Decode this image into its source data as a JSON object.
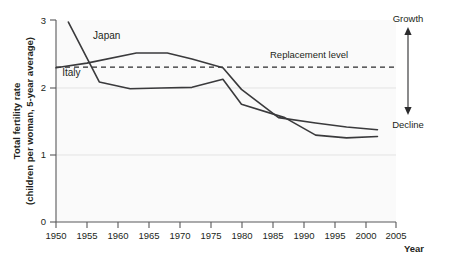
{
  "chart_data": {
    "type": "line",
    "title": "",
    "xlabel": "Year",
    "ylabel_line1": "Total fertility rate",
    "ylabel_line2": "(children per woman, 5-year average)",
    "xlim": [
      1950,
      2005
    ],
    "ylim": [
      0,
      3
    ],
    "xticks": [
      1950,
      1955,
      1960,
      1965,
      1970,
      1975,
      1980,
      1985,
      1990,
      1995,
      2000,
      2005
    ],
    "yticks": [
      0,
      1,
      2,
      3
    ],
    "grid": "horizontal-light",
    "legend_position": "inline-labels",
    "series": [
      {
        "name": "Japan",
        "label_x": 1956,
        "label_y": 2.72,
        "x": [
          1952,
          1957,
          1962,
          1967,
          1972,
          1977,
          1980,
          1987,
          1992,
          1997,
          2002
        ],
        "values": [
          2.97,
          2.08,
          1.98,
          1.99,
          2.0,
          2.12,
          1.75,
          1.55,
          1.29,
          1.25,
          1.27
        ]
      },
      {
        "name": "Italy",
        "label_x": 1951,
        "label_y": 2.17,
        "x": [
          1950,
          1955,
          1963,
          1968,
          1972,
          1977,
          1980,
          1986,
          1992,
          1997,
          2002
        ],
        "values": [
          2.29,
          2.36,
          2.51,
          2.51,
          2.42,
          2.29,
          1.97,
          1.55,
          1.47,
          1.41,
          1.37
        ]
      }
    ],
    "annotations": [
      {
        "name": "replacement-level",
        "label": "Replacement level",
        "y": 2.3,
        "type": "dashed-hline"
      },
      {
        "name": "growth-label",
        "label": "Growth",
        "type": "text-above-arrow"
      },
      {
        "name": "decline-label",
        "label": "Decline",
        "type": "text-below-arrow"
      }
    ],
    "colors": {
      "line": "#3a3a3c",
      "axis": "#58585a",
      "grid": "#e3e3e3",
      "background": "#fafafa",
      "text": "#231f20"
    }
  }
}
